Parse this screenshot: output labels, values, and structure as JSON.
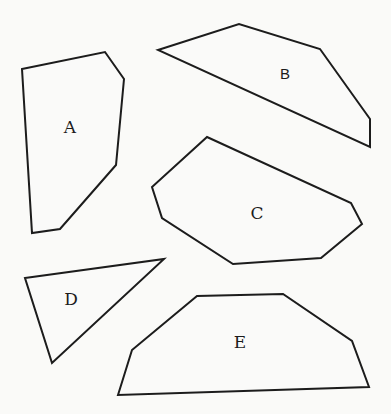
{
  "shapes": [
    {
      "id": "A",
      "label": "A",
      "font": "serif",
      "points": "22,69 105,52 124,79 116,165 60,229 32,233",
      "label_pos": [
        70,
        127
      ]
    },
    {
      "id": "B",
      "label": "B",
      "font": "sans",
      "points": "158,50 239,24 320,49 370,119 370,147",
      "label_pos": [
        285,
        73
      ]
    },
    {
      "id": "C",
      "label": "C",
      "font": "serif",
      "points": "207,137 351,203 362,224 321,258 233,264 162,218 152,187",
      "label_pos": [
        257,
        213
      ]
    },
    {
      "id": "D",
      "label": "D",
      "font": "serif",
      "points": "25,278 164,259 52,363",
      "label_pos": [
        71,
        299
      ]
    },
    {
      "id": "E",
      "label": "E",
      "font": "serif",
      "points": "118,395 132,350 197,296 283,294 352,341 369,387",
      "label_pos": [
        240,
        342
      ]
    }
  ]
}
